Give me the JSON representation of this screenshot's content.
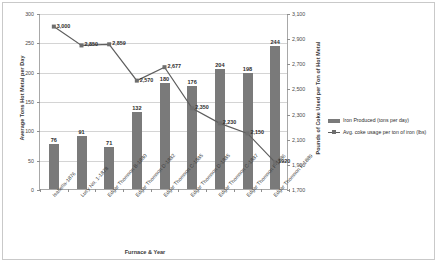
{
  "chart_data": {
    "type": "bar",
    "title": "",
    "xlabel": "Furnace & Year",
    "ylabel": "Average Tons Hot Metal per Day",
    "y2label": "Pounds of Coke Used per Ton of Hot Metal",
    "grid": true,
    "legend_position": "right",
    "ylim": [
      0,
      300
    ],
    "y2lim": [
      1700,
      3100
    ],
    "yticks": [
      "0",
      "50",
      "100",
      "150",
      "200",
      "250",
      "300"
    ],
    "y2ticks": [
      "1,700",
      "1,900",
      "2,100",
      "2,300",
      "2,500",
      "2,700",
      "2,900",
      "3,100"
    ],
    "categories": [
      "Isabella-1876",
      "Lucy No. 1-1878",
      "Edgar Thomson B-1880",
      "Edgar Thomson D-1882",
      "Edgar Thomson C-1885",
      "Edgar Thomson D-1885",
      "Edgar Thomson C-1887",
      "Edgar Thomson F-1886",
      "Edgar Thomson F-1889"
    ],
    "series": [
      {
        "name": "Iron Produced (tons per day)",
        "type": "bar",
        "axis": "left",
        "color": "#7a7a7a",
        "values": [
          76,
          91,
          71,
          132,
          180,
          176,
          204,
          198,
          244
        ],
        "labels": [
          "76",
          "91",
          "71",
          "132",
          "180",
          "176",
          "204",
          "198",
          "244"
        ]
      },
      {
        "name": "Avg. coke usage per ton of iron (lbs)",
        "type": "line",
        "axis": "right",
        "color": "#5e5e5e",
        "values": [
          3000,
          2850,
          2859,
          2570,
          2677,
          2350,
          2230,
          2150,
          1920
        ],
        "labels": [
          "3,000",
          "2,850",
          "2,859",
          "2,570",
          "2,677",
          "2,350",
          "2,230",
          "2,150",
          "1920"
        ]
      }
    ]
  },
  "legend": {
    "items": [
      "Iron Produced (tons per day)",
      "Avg. coke usage per ton of iron (lbs)"
    ]
  }
}
